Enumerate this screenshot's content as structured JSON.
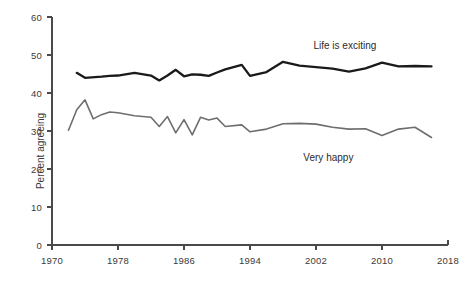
{
  "chart_data": {
    "type": "line",
    "title": "",
    "subtitle": "",
    "xlabel": "",
    "ylabel": "Percent agreeing",
    "xlim": [
      1970,
      2018
    ],
    "ylim": [
      0,
      60
    ],
    "grid": false,
    "legend_position": "inline-annotation",
    "xticks": [
      "1970",
      "1978",
      "1986",
      "1994",
      "2002",
      "2010",
      "2018"
    ],
    "xtick_values": [
      1970,
      1978,
      1986,
      1994,
      2002,
      2010,
      2018
    ],
    "yticks": [
      "0",
      "10",
      "20",
      "30",
      "40",
      "50",
      "60"
    ],
    "ytick_values": [
      0,
      10,
      20,
      30,
      40,
      50,
      60
    ],
    "series": [
      {
        "name": "Life is exciting",
        "color": "#1a1a1a",
        "line_width": 2.3,
        "annotation": "Life is exciting",
        "annotation_x": 2005.5,
        "annotation_y": 54.0,
        "x": [
          1973,
          1974,
          1976,
          1977,
          1978,
          1980,
          1982,
          1983,
          1984,
          1985,
          1986,
          1987,
          1988,
          1989,
          1990,
          1991,
          1993,
          1994,
          1996,
          1998,
          2000,
          2002,
          2004,
          2006,
          2008,
          2010,
          2012,
          2014,
          2016
        ],
        "values": [
          45.3,
          44.0,
          44.3,
          44.5,
          44.6,
          45.3,
          44.6,
          43.3,
          44.6,
          46.1,
          44.4,
          44.9,
          44.8,
          44.5,
          45.4,
          46.2,
          47.4,
          44.5,
          45.5,
          48.2,
          47.2,
          46.8,
          46.4,
          45.6,
          46.5,
          48.0,
          47.0,
          47.1,
          47.0
        ]
      },
      {
        "name": "Very happy",
        "color": "#6e6e6e",
        "line_width": 1.6,
        "annotation": "Very happy",
        "annotation_x": 2003.5,
        "annotation_y": 24.5,
        "x": [
          1972,
          1973,
          1974,
          1975,
          1976,
          1977,
          1978,
          1980,
          1982,
          1983,
          1984,
          1985,
          1986,
          1987,
          1988,
          1989,
          1990,
          1991,
          1993,
          1994,
          1996,
          1998,
          2000,
          2002,
          2004,
          2006,
          2008,
          2010,
          2012,
          2014,
          2016
        ],
        "values": [
          30.2,
          35.6,
          38.2,
          33.2,
          34.3,
          35.0,
          34.8,
          34.0,
          33.6,
          31.2,
          33.8,
          29.5,
          33.0,
          29.0,
          33.6,
          32.9,
          33.4,
          31.2,
          31.6,
          29.8,
          30.5,
          31.9,
          32.0,
          31.8,
          31.0,
          30.5,
          30.6,
          28.8,
          30.5,
          31.0,
          28.3
        ]
      }
    ]
  },
  "axis_style": {
    "axis_color": "#4a4a4a",
    "axis_width": 1.4,
    "tick_length": 5
  }
}
